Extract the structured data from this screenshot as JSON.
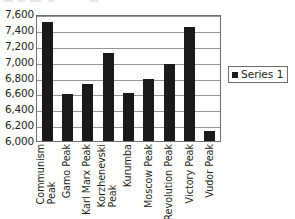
{
  "chart_data": {
    "type": "bar",
    "title": "",
    "subtitle": "",
    "xlabel": "",
    "ylabel": "",
    "categories": [
      "Communism Peak",
      "Gamo Peak",
      "Karl Marx Peak",
      "Korzhenevski Peak",
      "Kurumba",
      "Moscow Peak",
      "Revolution Peak",
      "Victory Peak",
      "Vudor Peak"
    ],
    "category_lines": [
      [
        "Communism",
        "Peak"
      ],
      [
        "Gamo Peak"
      ],
      [
        "Karl Marx Peak"
      ],
      [
        "Korzhenevski",
        "Peak"
      ],
      [
        "Kurumba"
      ],
      [
        "Moscow Peak"
      ],
      [
        "Revolution Peak"
      ],
      [
        "Victory Peak"
      ],
      [
        "Vudor Peak"
      ]
    ],
    "series": [
      {
        "name": "Series 1",
        "values": [
          7495,
          6595,
          6723,
          7105,
          6604,
          6785,
          6974,
          7439,
          6132
        ]
      }
    ],
    "values": [
      7495,
      6595,
      6723,
      7105,
      6604,
      6785,
      6974,
      7439,
      6132
    ],
    "ylim": [
      6000,
      7600
    ],
    "ytick_step": 200,
    "ytick_labels": [
      "7,600",
      "7,400",
      "7,200",
      "7,000",
      "6,800",
      "6,600",
      "6,400",
      "6,200",
      "6,000"
    ],
    "ytick_values": [
      7600,
      7400,
      7200,
      7000,
      6800,
      6600,
      6400,
      6200,
      6000
    ],
    "grid": true,
    "grid_axis": "y",
    "legend": {
      "position": "right",
      "entries": [
        {
          "label": "Series 1",
          "color": "#1a1a1a",
          "marker": "square"
        }
      ]
    },
    "colors": {
      "bar": "#1a1a1a",
      "gridline": "#949494",
      "axis": "#6f6f6f",
      "text": "#231f20",
      "background": "#ffffff"
    }
  }
}
